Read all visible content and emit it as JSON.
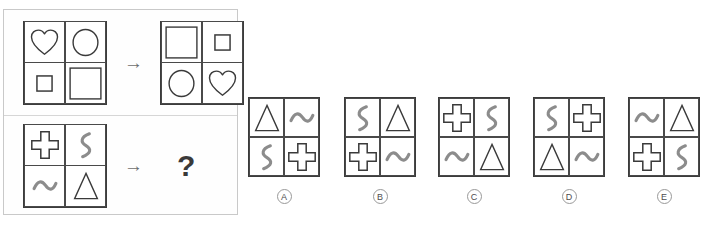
{
  "puzzle": {
    "type": "abstract-reasoning-matrix-analogy",
    "arrow_glyph": "→",
    "question_glyph": "?",
    "shape_legend": {
      "heart": "heart-outline",
      "circle": "circle-outline",
      "square-small": "small-square-outline",
      "square-large": "large-square-outline",
      "plus": "plus-cross-outline",
      "squiggle": "vertical-squiggle",
      "tilde": "horizontal-wave",
      "triangle": "triangle-outline"
    },
    "examples": [
      {
        "id": "example-1",
        "source_matrix": {
          "cells": [
            "heart",
            "circle",
            "square-small",
            "square-large"
          ]
        },
        "result_matrix": {
          "cells": [
            "square-large",
            "square-small",
            "circle",
            "heart"
          ]
        }
      },
      {
        "id": "example-2",
        "source_matrix": {
          "cells": [
            "plus",
            "squiggle",
            "tilde",
            "triangle"
          ]
        },
        "result_matrix": {
          "cells": [
            "?",
            "?",
            "?",
            "?"
          ],
          "unknown": true
        }
      }
    ],
    "options": [
      {
        "label": "A",
        "cells": [
          "triangle",
          "tilde",
          "squiggle",
          "plus"
        ]
      },
      {
        "label": "B",
        "cells": [
          "squiggle",
          "triangle",
          "plus",
          "tilde"
        ]
      },
      {
        "label": "C",
        "cells": [
          "plus",
          "squiggle",
          "tilde",
          "triangle"
        ]
      },
      {
        "label": "D",
        "cells": [
          "squiggle",
          "plus",
          "triangle",
          "tilde"
        ]
      },
      {
        "label": "E",
        "cells": [
          "tilde",
          "triangle",
          "plus",
          "squiggle"
        ]
      }
    ],
    "colors": {
      "matrix_border": "#3c3c3c",
      "cell_border": "#4a4a4a",
      "outline_shape": "#3a3a3a",
      "wave_shape": "#8c8c8c",
      "panel_border": "#c9c9c9",
      "arrow": "#6d6d6d",
      "label_ring": "#999999",
      "background": "#ffffff"
    }
  }
}
